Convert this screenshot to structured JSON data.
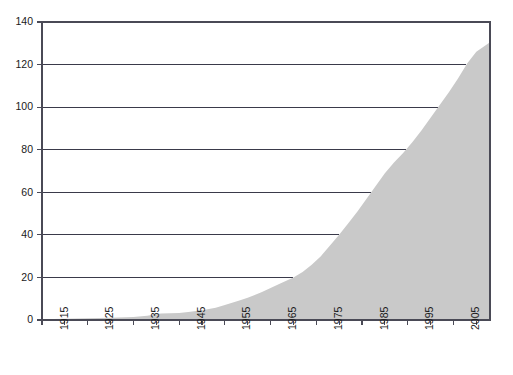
{
  "chart_data": {
    "type": "area",
    "title": "",
    "subtitle": "",
    "xlabel": "",
    "ylabel": "",
    "xlim": [
      1910,
      2008
    ],
    "ylim": [
      0,
      140
    ],
    "grid": true,
    "legend": null,
    "fill_color": "#c9c9c9",
    "axis_color": "#4a4a56",
    "grid_color": "#3a3a4a",
    "background_color": "#ffffff",
    "y_ticks": [
      0,
      20,
      40,
      60,
      80,
      100,
      120,
      140
    ],
    "y_tick_labels": [
      "0",
      "20",
      "40",
      "60",
      "80",
      "100",
      "120",
      "140"
    ],
    "x_ticks": [
      1915,
      1925,
      1935,
      1945,
      1955,
      1965,
      1975,
      1985,
      1995,
      2005
    ],
    "x_tick_labels": [
      "1915",
      "1925",
      "1935",
      "1945",
      "1955",
      "1965",
      "1975",
      "1985",
      "1995",
      "2005"
    ],
    "x_minor_ticks": [
      1910,
      1920,
      1930,
      1940,
      1950,
      1960,
      1970,
      1980,
      1990,
      2000
    ],
    "x": [
      1910,
      1915,
      1920,
      1925,
      1930,
      1933,
      1936,
      1938,
      1940,
      1942,
      1945,
      1948,
      1950,
      1953,
      1955,
      1958,
      1960,
      1962,
      1965,
      1967,
      1969,
      1971,
      1973,
      1975,
      1977,
      1979,
      1981,
      1983,
      1985,
      1987,
      1989,
      1991,
      1993,
      1995,
      1997,
      1999,
      2001,
      2003,
      2005,
      2008
    ],
    "values": [
      0.4,
      0.6,
      0.8,
      1.0,
      1.4,
      2.0,
      3.1,
      3.2,
      3.3,
      3.8,
      4.6,
      5.8,
      7.0,
      9.0,
      10.5,
      13.0,
      15.0,
      17.0,
      20.0,
      22.5,
      26.0,
      30.0,
      35.0,
      40.0,
      45.5,
      51.0,
      57.0,
      63.0,
      69.0,
      74.0,
      78.5,
      83.5,
      89.0,
      95.0,
      101.0,
      107.0,
      113.5,
      120.5,
      126.0,
      130.5
    ],
    "series": [
      {
        "name": "cumulative total",
        "values": [
          0.4,
          0.6,
          0.8,
          1.0,
          1.4,
          2.0,
          3.1,
          3.2,
          3.3,
          3.8,
          4.6,
          5.8,
          7.0,
          9.0,
          10.5,
          13.0,
          15.0,
          17.0,
          20.0,
          22.5,
          26.0,
          30.0,
          35.0,
          40.0,
          45.5,
          51.0,
          57.0,
          63.0,
          69.0,
          74.0,
          78.5,
          83.5,
          89.0,
          95.0,
          101.0,
          107.0,
          113.5,
          120.5,
          126.0,
          130.5
        ]
      }
    ]
  }
}
